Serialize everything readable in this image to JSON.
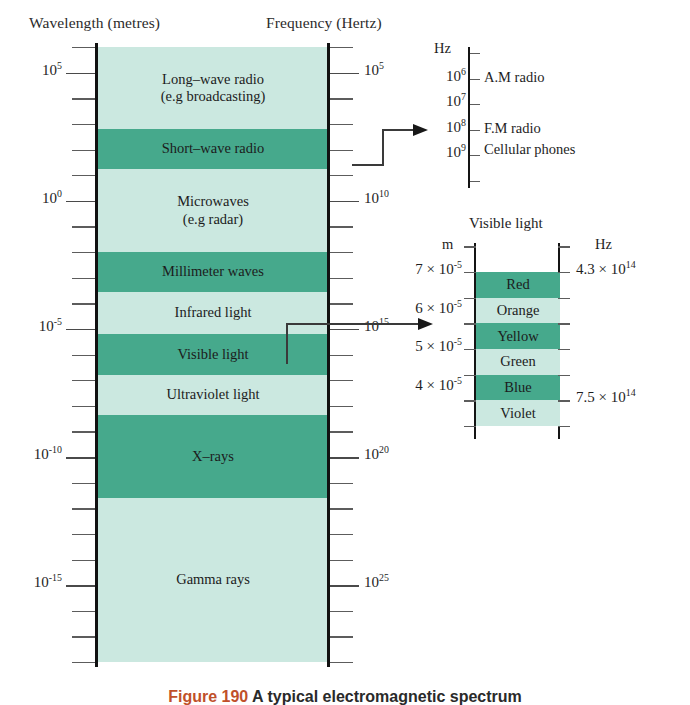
{
  "figure": {
    "caption_label": "Figure 190",
    "caption_rest": "A typical electromagnetic spectrum"
  },
  "colors": {
    "band_light": "#cbe8e0",
    "band_dark": "#46a98c",
    "axis": "#111111",
    "tick": "#5c5c5c",
    "text": "#1c1c1c",
    "caption_accent": "#c0502a"
  },
  "main": {
    "left_axis_header": "Wavelength (metres)",
    "right_axis_header": "Frequency (Hertz)",
    "wavelength_ticks": [
      {
        "label": "10",
        "exp": "5"
      },
      {
        "label": "10",
        "exp": "0"
      },
      {
        "label": "10",
        "exp": "-5"
      },
      {
        "label": "10",
        "exp": "-10"
      },
      {
        "label": "10",
        "exp": "-15"
      }
    ],
    "frequency_ticks": [
      {
        "label": "10",
        "exp": "5"
      },
      {
        "label": "10",
        "exp": "10"
      },
      {
        "label": "10",
        "exp": "15"
      },
      {
        "label": "10",
        "exp": "20"
      },
      {
        "label": "10",
        "exp": "25"
      }
    ],
    "bands": [
      {
        "name": "long-wave-radio",
        "line1": "Long–wave radio",
        "line2": "(e.g broadcasting)",
        "shade": "light"
      },
      {
        "name": "short-wave-radio",
        "line1": "Short–wave radio",
        "line2": "",
        "shade": "dark"
      },
      {
        "name": "microwaves",
        "line1": "Microwaves",
        "line2": "(e.g radar)",
        "shade": "light"
      },
      {
        "name": "millimeter-waves",
        "line1": "Millimeter waves",
        "line2": "",
        "shade": "dark"
      },
      {
        "name": "infrared-light",
        "line1": "Infrared light",
        "line2": "",
        "shade": "light"
      },
      {
        "name": "visible-light",
        "line1": "Visible light",
        "line2": "",
        "shade": "dark"
      },
      {
        "name": "ultraviolet-light",
        "line1": "Ultraviolet light",
        "line2": "",
        "shade": "light"
      },
      {
        "name": "x-rays",
        "line1": "X–rays",
        "line2": "",
        "shade": "dark"
      },
      {
        "name": "gamma-rays",
        "line1": "Gamma rays",
        "line2": "",
        "shade": "light"
      }
    ]
  },
  "radio_inset": {
    "unit": "Hz",
    "ticks": [
      {
        "label": "10",
        "exp": "6"
      },
      {
        "label": "10",
        "exp": "7"
      },
      {
        "label": "10",
        "exp": "8"
      },
      {
        "label": "10",
        "exp": "9"
      }
    ],
    "entries": [
      "A.M  radio",
      "F.M radio",
      "Cellular phones"
    ]
  },
  "visible_inset": {
    "title": "Visible light",
    "unit_left": "m",
    "unit_right": "Hz",
    "wavelength_ticks": [
      {
        "label": "7 × 10",
        "exp": "-5"
      },
      {
        "label": "6 × 10",
        "exp": "-5"
      },
      {
        "label": "5 × 10",
        "exp": "-5"
      },
      {
        "label": "4 × 10",
        "exp": "-5"
      }
    ],
    "frequency_ticks": [
      {
        "label": "4.3 × 10",
        "exp": "14"
      },
      {
        "label": "7.5 × 10",
        "exp": "14"
      }
    ],
    "bands": [
      {
        "name": "red",
        "label": "Red",
        "shade": "dark"
      },
      {
        "name": "orange",
        "label": "Orange",
        "shade": "light"
      },
      {
        "name": "yellow",
        "label": "Yellow",
        "shade": "dark"
      },
      {
        "name": "green",
        "label": "Green",
        "shade": "light"
      },
      {
        "name": "blue",
        "label": "Blue",
        "shade": "dark"
      },
      {
        "name": "violet",
        "label": "Violet",
        "shade": "light"
      }
    ]
  },
  "chart_data": {
    "type": "bar",
    "title": "Electromagnetic spectrum",
    "orientation": "vertical-log-scale",
    "xlabel": "",
    "ylabel": "Wavelength (metres) / Frequency (Hertz)",
    "left_axis": {
      "name": "Wavelength",
      "unit": "metres",
      "scale": "log10",
      "tick_values": [
        100000.0,
        1.0,
        1e-05,
        1e-10,
        1e-15
      ],
      "tick_labels": [
        "10^5",
        "10^0",
        "10^-5",
        "10^-10",
        "10^-15"
      ],
      "range": [
        3160000.0,
        3.16e-17
      ]
    },
    "right_axis": {
      "name": "Frequency",
      "unit": "Hertz",
      "scale": "log10",
      "tick_values": [
        100000.0,
        10000000000.0,
        1000000000000000.0,
        1e+20,
        1e+25
      ],
      "tick_labels": [
        "10^5",
        "10^10",
        "10^15",
        "10^20",
        "10^25"
      ],
      "range": [
        316.0,
        3.16e+25
      ]
    },
    "grid": false,
    "legend": "none",
    "categories": [
      "Long-wave radio (e.g broadcasting)",
      "Short-wave radio",
      "Microwaves (e.g radar)",
      "Millimeter waves",
      "Infrared light",
      "Visible light",
      "Ultraviolet light",
      "X-rays",
      "Gamma rays"
    ],
    "bands": [
      {
        "name": "Long-wave radio (e.g broadcasting)",
        "wavelength_m": [
          1000000.0,
          1000.0
        ],
        "shade": "light"
      },
      {
        "name": "Short-wave radio",
        "wavelength_m": [
          1000.0,
          10.0
        ],
        "shade": "dark"
      },
      {
        "name": "Microwaves (e.g radar)",
        "wavelength_m": [
          10.0,
          0.01
        ],
        "shade": "light"
      },
      {
        "name": "Millimeter waves",
        "wavelength_m": [
          0.01,
          0.001
        ],
        "shade": "dark"
      },
      {
        "name": "Infrared light",
        "wavelength_m": [
          0.001,
          7e-05
        ],
        "shade": "light"
      },
      {
        "name": "Visible light",
        "wavelength_m": [
          7e-05,
          4e-05
        ],
        "shade": "dark"
      },
      {
        "name": "Ultraviolet light",
        "wavelength_m": [
          4e-05,
          1e-08
        ],
        "shade": "light"
      },
      {
        "name": "X-rays",
        "wavelength_m": [
          1e-08,
          1e-11
        ],
        "shade": "dark"
      },
      {
        "name": "Gamma rays",
        "wavelength_m": [
          1e-11,
          1e-16
        ],
        "shade": "light"
      }
    ],
    "insets": [
      {
        "name": "Radio detail",
        "axis": "Frequency (Hz)",
        "tick_values": [
          1000000.0,
          10000000.0,
          100000000.0,
          1000000000.0
        ],
        "tick_labels": [
          "10^6",
          "10^7",
          "10^8",
          "10^9"
        ],
        "annotations": [
          {
            "label": "A.M  radio",
            "frequency_hz": 1000000.0
          },
          {
            "label": "F.M radio",
            "frequency_hz": 100000000.0
          },
          {
            "label": "Cellular phones",
            "frequency_hz": 900000000.0
          }
        ]
      },
      {
        "name": "Visible light",
        "left_axis": "Wavelength (m)",
        "right_axis": "Frequency (Hz)",
        "left_tick_values": [
          7e-05,
          6e-05,
          5e-05,
          4e-05
        ],
        "left_tick_labels": [
          "7 × 10^-5",
          "6 × 10^-5",
          "5 × 10^-5",
          "4 × 10^-5"
        ],
        "right_tick_values": [
          430000000000000.0,
          750000000000000.0
        ],
        "right_tick_labels": [
          "4.3 × 10^14",
          "7.5 × 10^14"
        ],
        "categories": [
          "Red",
          "Orange",
          "Yellow",
          "Green",
          "Blue",
          "Violet"
        ],
        "shades": [
          "dark",
          "light",
          "dark",
          "light",
          "dark",
          "light"
        ]
      }
    ]
  }
}
